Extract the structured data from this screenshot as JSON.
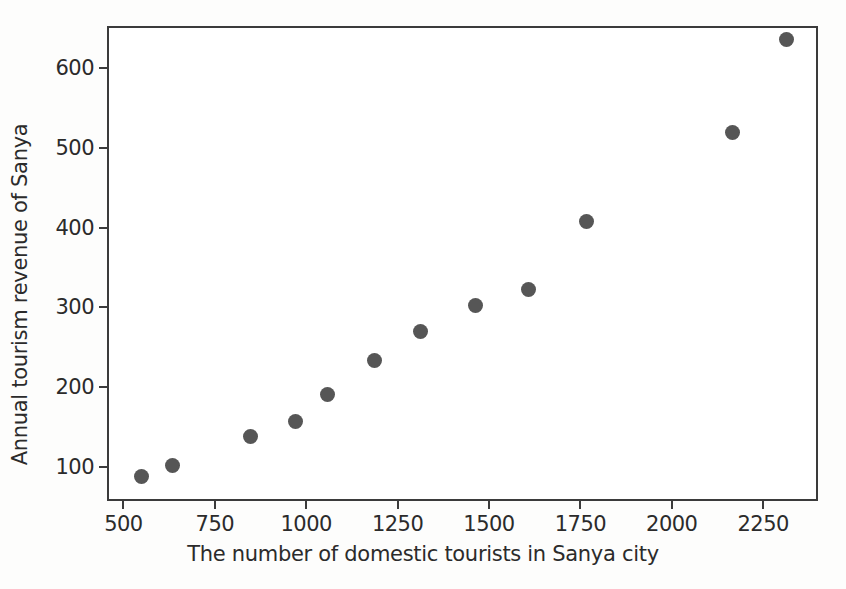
{
  "chart_data": {
    "type": "scatter",
    "title": "",
    "xlabel": "The number of domestic tourists in Sanya city",
    "ylabel": "Annual tourism revenue of Sanya",
    "xlim": [
      455,
      2400
    ],
    "ylim": [
      58,
      652
    ],
    "xticks": [
      500,
      750,
      1000,
      1250,
      1500,
      1750,
      2000,
      2250
    ],
    "yticks": [
      100,
      200,
      300,
      400,
      500,
      600
    ],
    "xticklabels": [
      "500",
      "750",
      "1000",
      "1250",
      "1500",
      "1750",
      "2000",
      "2250"
    ],
    "yticklabels": [
      "100",
      "200",
      "300",
      "400",
      "500",
      "600"
    ],
    "grid": false,
    "legend": null,
    "marker": {
      "shape": "circle",
      "color": "#565656",
      "size": 15
    },
    "series": [
      {
        "name": "Sanya tourism",
        "x": [
          544,
          628,
          842,
          965,
          1052,
          1181,
          1307,
          1457,
          1602,
          1760,
          2160,
          2307
        ],
        "y": [
          91,
          105,
          141,
          160,
          194,
          236,
          272,
          305,
          325,
          410,
          521,
          638
        ]
      }
    ],
    "points": [
      {
        "x": 544,
        "y": 91
      },
      {
        "x": 628,
        "y": 105
      },
      {
        "x": 842,
        "y": 141
      },
      {
        "x": 965,
        "y": 160
      },
      {
        "x": 1052,
        "y": 194
      },
      {
        "x": 1181,
        "y": 236
      },
      {
        "x": 1307,
        "y": 272
      },
      {
        "x": 1457,
        "y": 305
      },
      {
        "x": 1602,
        "y": 325
      },
      {
        "x": 1760,
        "y": 410
      },
      {
        "x": 2160,
        "y": 521
      },
      {
        "x": 2307,
        "y": 638
      }
    ]
  }
}
